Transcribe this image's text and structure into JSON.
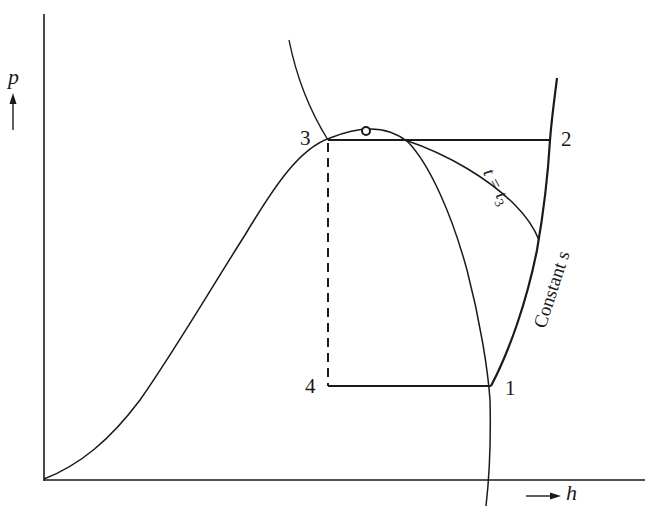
{
  "diagram": {
    "type": "pressure-enthalpy (p-h) diagram of vapor-compression refrigeration cycle",
    "axes": {
      "y_label": "p",
      "x_label": "h",
      "y_arrow": "up-arrow",
      "x_arrow": "right-arrow"
    },
    "points": [
      {
        "id": "1",
        "label": "1",
        "description": "compressor inlet, saturated vapor at low pressure"
      },
      {
        "id": "2",
        "label": "2",
        "description": "compressor outlet, superheated vapor at high pressure"
      },
      {
        "id": "3",
        "label": "3",
        "description": "saturated liquid at high pressure"
      },
      {
        "id": "4",
        "label": "4",
        "description": "after expansion, low pressure"
      }
    ],
    "curve_labels": {
      "isotherm": "t = t",
      "isotherm_sub": "3",
      "isentrope": "Constant s"
    },
    "critical_point_icon": "open-circle"
  },
  "colors": {
    "line": "#1a1a1a",
    "background": "#ffffff"
  }
}
